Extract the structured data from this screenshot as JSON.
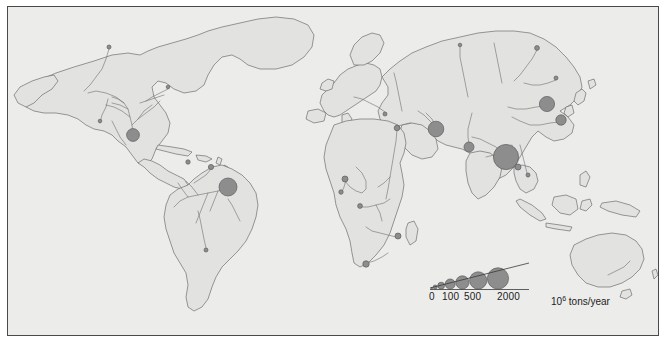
{
  "figure": {
    "type": "thematic-world-map",
    "background_color": "#ececea",
    "land_color": "#e2e2e0",
    "outline_color": "#6e6e6e",
    "symbol_color": "#8d8d8d",
    "symbol_outline_color": "#5d5d5d",
    "border_color": "#4a4a4a"
  },
  "legend": {
    "units_html": "10<sup>6</sup> tons/year",
    "units_text": "10^6 tons/year",
    "tick_labels": [
      "0",
      "100",
      "500",
      "2000"
    ],
    "tick_values": [
      0,
      100,
      500,
      2000
    ],
    "swatches": [
      {
        "value": 0,
        "r": 0.8
      },
      {
        "value": 25,
        "r": 2.0
      },
      {
        "value": 100,
        "r": 3.4
      },
      {
        "value": 250,
        "r": 5.0
      },
      {
        "value": 500,
        "r": 6.6
      },
      {
        "value": 1000,
        "r": 8.6
      },
      {
        "value": 2000,
        "r": 10.6
      }
    ]
  },
  "chart_data": {
    "type": "scatter",
    "title": "",
    "xlabel": "",
    "ylabel": "",
    "value_unit": "10^6 tons/year",
    "symbol": "graduated-circle",
    "series": [
      {
        "name": "Mississippi",
        "x": 125,
        "y": 128,
        "r": 6.4,
        "value": 350
      },
      {
        "name": "Amazon",
        "x": 220,
        "y": 180,
        "r": 9.0,
        "value": 900
      },
      {
        "name": "Orinoco",
        "x": 203,
        "y": 160,
        "r": 2.6,
        "value": 90
      },
      {
        "name": "Magdalena",
        "x": 180,
        "y": 155,
        "r": 2.2,
        "value": 60
      },
      {
        "name": "Parana",
        "x": 198,
        "y": 243,
        "r": 2.0,
        "value": 50
      },
      {
        "name": "Niger",
        "x": 337,
        "y": 172,
        "r": 3.0,
        "value": 100
      },
      {
        "name": "Volta",
        "x": 333,
        "y": 185,
        "r": 2.2,
        "value": 60
      },
      {
        "name": "Congo",
        "x": 352,
        "y": 199,
        "r": 2.4,
        "value": 70
      },
      {
        "name": "Zambezi",
        "x": 390,
        "y": 229,
        "r": 3.0,
        "value": 100
      },
      {
        "name": "Orange",
        "x": 358,
        "y": 257,
        "r": 3.2,
        "value": 110
      },
      {
        "name": "Nile",
        "x": 389,
        "y": 121,
        "r": 2.8,
        "value": 95
      },
      {
        "name": "Danube",
        "x": 377,
        "y": 107,
        "r": 2.0,
        "value": 50
      },
      {
        "name": "Tigris-Euphrates",
        "x": 428,
        "y": 122,
        "r": 7.8,
        "value": 600
      },
      {
        "name": "Indus",
        "x": 461,
        "y": 140,
        "r": 5.0,
        "value": 250
      },
      {
        "name": "Ganges-Brahmaputra",
        "x": 498,
        "y": 150,
        "r": 12.6,
        "value": 2000
      },
      {
        "name": "Irrawaddy",
        "x": 510,
        "y": 160,
        "r": 3.0,
        "value": 100
      },
      {
        "name": "Mekong",
        "x": 520,
        "y": 168,
        "r": 2.0,
        "value": 50
      },
      {
        "name": "Huang He",
        "x": 539,
        "y": 97,
        "r": 7.6,
        "value": 580
      },
      {
        "name": "Yangtze",
        "x": 553,
        "y": 113,
        "r": 5.2,
        "value": 270
      },
      {
        "name": "Lena",
        "x": 529,
        "y": 41,
        "r": 2.4,
        "value": 70
      },
      {
        "name": "Ob",
        "x": 452,
        "y": 38,
        "r": 1.8,
        "value": 40
      },
      {
        "name": "Amur",
        "x": 548,
        "y": 71,
        "r": 2.0,
        "value": 50
      },
      {
        "name": "Mackenzie",
        "x": 101,
        "y": 40,
        "r": 2.0,
        "value": 50
      },
      {
        "name": "St Lawrence",
        "x": 160,
        "y": 80,
        "r": 1.8,
        "value": 40
      },
      {
        "name": "Colorado",
        "x": 92,
        "y": 114,
        "r": 1.8,
        "value": 40
      }
    ]
  }
}
